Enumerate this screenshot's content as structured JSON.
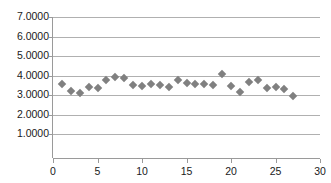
{
  "chart_data": {
    "type": "scatter",
    "title": "",
    "subtitle": "",
    "xlabel": "",
    "ylabel": "",
    "xlim": [
      0,
      30
    ],
    "ylim": [
      0,
      7
    ],
    "grid": "horizontal",
    "legend": "none",
    "marker": {
      "shape": "diamond",
      "color": "#808080",
      "size_px": 6
    },
    "y_ticks": [
      1,
      2,
      3,
      4,
      5,
      6,
      7
    ],
    "y_tick_labels": [
      "1.0000",
      "2.0000",
      "3.0000",
      "4.0000",
      "5.0000",
      "6.0000",
      "7.0000"
    ],
    "x_ticks": [
      0,
      5,
      10,
      15,
      20,
      25,
      30
    ],
    "x_tick_labels": [
      "0",
      "5",
      "10",
      "15",
      "20",
      "25",
      "30"
    ],
    "series": [
      {
        "name": "series-1",
        "x": [
          1,
          2,
          3,
          4,
          5,
          6,
          7,
          8,
          9,
          10,
          11,
          12,
          13,
          14,
          15,
          16,
          17,
          18,
          19,
          20,
          21,
          22,
          23,
          24,
          25,
          26,
          27
        ],
        "values": [
          3.57,
          3.21,
          3.12,
          3.4,
          3.37,
          3.76,
          3.94,
          3.89,
          3.52,
          3.45,
          3.57,
          3.52,
          3.42,
          3.8,
          3.61,
          3.57,
          3.6,
          3.53,
          4.1,
          3.5,
          3.15,
          3.69,
          3.77,
          3.35,
          3.44,
          3.34,
          2.97
        ]
      }
    ]
  },
  "axes": {
    "y_axis_name": "value-axis",
    "x_axis_name": "index-axis"
  }
}
